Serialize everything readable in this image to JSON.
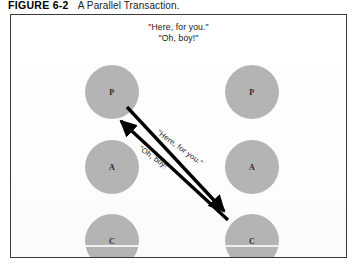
{
  "caption": {
    "number": "FIGURE 6-2",
    "text": "A Parallel Transaction."
  },
  "figure": {
    "header_quotes": [
      "\"Here, for you.\"",
      "\"Oh, boy!\""
    ],
    "columns": [
      {
        "id": "left",
        "name": "initiator",
        "nodes": [
          {
            "label": "P",
            "role": "Parent"
          },
          {
            "label": "A",
            "role": "Adult"
          },
          {
            "label": "C",
            "role": "Child"
          }
        ]
      },
      {
        "id": "right",
        "name": "respondent",
        "nodes": [
          {
            "label": "P",
            "role": "Parent"
          },
          {
            "label": "A",
            "role": "Adult"
          },
          {
            "label": "C",
            "role": "Child"
          }
        ]
      }
    ],
    "arrows": [
      {
        "id": "stimulus",
        "label": "\"Here, for you.\"",
        "from": "left-P",
        "to": "right-C",
        "direction": "down-right",
        "color": "#000000"
      },
      {
        "id": "response",
        "label": "\"Oh, boy!\"",
        "from": "right-C",
        "to": "left-P",
        "direction": "up-left",
        "color": "#000000"
      }
    ],
    "colors": {
      "node_fill": "#b4b4b4",
      "arrow": "#000000",
      "frame_border": "#3a3a3a",
      "background": "#ffffff"
    }
  }
}
